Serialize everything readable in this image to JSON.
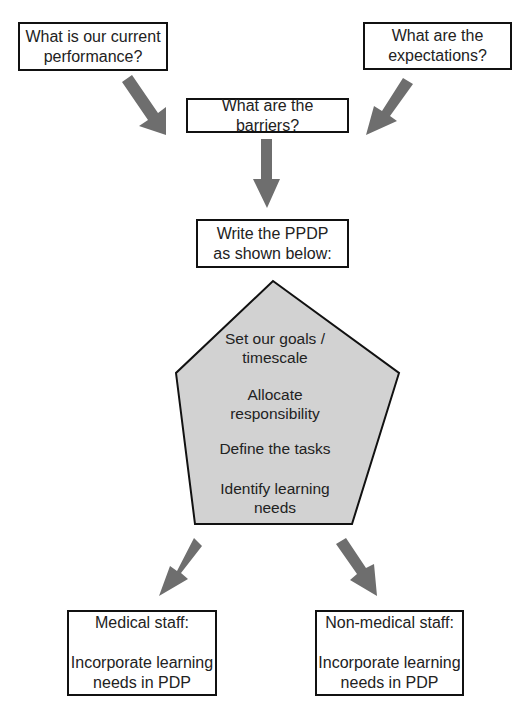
{
  "diagram": {
    "top_left": {
      "lines": [
        "What is our current",
        "performance?"
      ]
    },
    "top_right": {
      "lines": [
        "What are the",
        "expectations?"
      ]
    },
    "barriers": {
      "lines": [
        "What are the barriers?"
      ]
    },
    "write": {
      "lines": [
        "Write the PPDP",
        "as shown below:"
      ]
    },
    "pentagon": {
      "items": [
        {
          "lines": [
            "Set our goals /",
            "timescale"
          ]
        },
        {
          "lines": [
            "Allocate",
            "responsibility"
          ]
        },
        {
          "lines": [
            "Define the tasks"
          ]
        },
        {
          "lines": [
            "Identify learning",
            "needs"
          ]
        }
      ]
    },
    "bottom_left": {
      "lines": [
        "Medical staff:",
        "",
        "Incorporate learning",
        "needs in PDP"
      ]
    },
    "bottom_right": {
      "lines": [
        "Non-medical staff:",
        "",
        "Incorporate learning",
        "needs in PDP"
      ]
    },
    "colors": {
      "arrow": "#6e6e6e",
      "pentagon_fill": "#d2d2d2",
      "border": "#111111"
    }
  }
}
